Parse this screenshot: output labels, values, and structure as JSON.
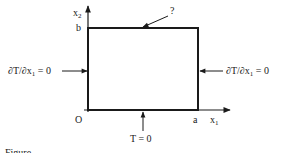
{
  "diagram": {
    "axes": {
      "x_label": "x",
      "x_sub": "1",
      "y_label": "x",
      "y_sub": "2",
      "origin": "O",
      "x_end": "a",
      "y_end": "b"
    },
    "boundary_conditions": {
      "left": {
        "text": "∂T/∂x",
        "sub": "1",
        "rhs": " = 0"
      },
      "right": {
        "text": "∂T/∂x",
        "sub": "1",
        "rhs": " = 0"
      },
      "bottom": {
        "text": "T = 0"
      },
      "top": {
        "text": "?"
      }
    },
    "caption": "Figure ..."
  },
  "colors": {
    "stroke": "#1a1a1a",
    "background": "#ffffff"
  }
}
